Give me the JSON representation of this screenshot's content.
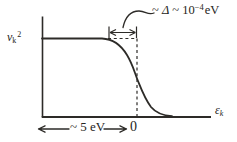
{
  "diagram": {
    "background": "#ffffff",
    "ink": "#2d2b28",
    "y_axis_label": {
      "base": "v",
      "sub": "k",
      "sup": "2"
    },
    "x_axis_label": {
      "base": "ε",
      "sub": "k"
    },
    "gap_annotation": {
      "lead": "~ ",
      "delta": "Δ",
      "mid": " ~ 10",
      "exponent": "−4",
      "unit": "eV"
    },
    "bottom_annotation": {
      "width_label": "~ 5 eV",
      "zero_label": "0"
    },
    "curve_shape": "plateau at v_k^2 for energies below 0 dropping sigmoidally to 0 around ε_k = 0 over a transition width ~Δ marked by dashed lines and a dimension arrow"
  }
}
